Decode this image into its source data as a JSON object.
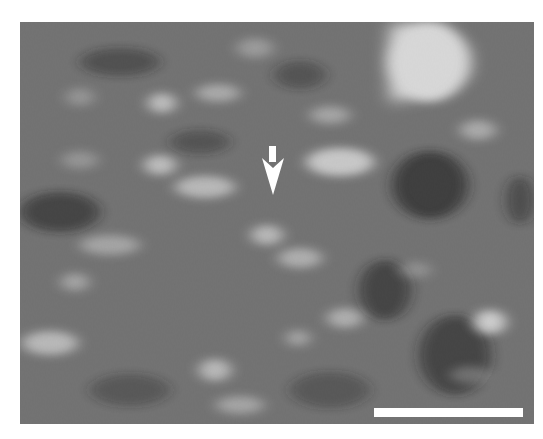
{
  "figure": {
    "type": "grayscale scanning-probe micrograph",
    "image_bounds": {
      "x": 20,
      "y": 22,
      "width": 514,
      "height": 402
    },
    "base_gray": "#717171",
    "annotations": {
      "arrow": {
        "color": "#ffffff",
        "direction": "down",
        "tip": {
          "x": 273,
          "y": 195
        },
        "shaft": {
          "x": 269,
          "y": 146,
          "width": 7,
          "height": 16
        },
        "head": {
          "left": 262,
          "right": 284,
          "top": 158,
          "bottom": 195
        }
      },
      "scale_bar": {
        "color": "#ffffff",
        "x": 374,
        "y": 408,
        "width": 149,
        "height": 9,
        "label": ""
      }
    },
    "bright_features": [
      {
        "cx": 428,
        "cy": 62,
        "rx": 42,
        "ry": 40,
        "opacity": 1.0
      },
      {
        "cx": 162,
        "cy": 103,
        "rx": 14,
        "ry": 10,
        "opacity": 0.75
      },
      {
        "cx": 218,
        "cy": 93,
        "rx": 22,
        "ry": 9,
        "opacity": 0.55
      },
      {
        "cx": 255,
        "cy": 48,
        "rx": 18,
        "ry": 10,
        "opacity": 0.4
      },
      {
        "cx": 80,
        "cy": 97,
        "rx": 14,
        "ry": 9,
        "opacity": 0.35
      },
      {
        "cx": 330,
        "cy": 115,
        "rx": 20,
        "ry": 9,
        "opacity": 0.5
      },
      {
        "cx": 478,
        "cy": 130,
        "rx": 18,
        "ry": 10,
        "opacity": 0.55
      },
      {
        "cx": 160,
        "cy": 165,
        "rx": 16,
        "ry": 10,
        "opacity": 0.75
      },
      {
        "cx": 340,
        "cy": 162,
        "rx": 34,
        "ry": 14,
        "opacity": 0.85
      },
      {
        "cx": 205,
        "cy": 187,
        "rx": 30,
        "ry": 11,
        "opacity": 0.7
      },
      {
        "cx": 267,
        "cy": 235,
        "rx": 16,
        "ry": 10,
        "opacity": 0.7
      },
      {
        "cx": 110,
        "cy": 245,
        "rx": 30,
        "ry": 10,
        "opacity": 0.5
      },
      {
        "cx": 300,
        "cy": 258,
        "rx": 22,
        "ry": 10,
        "opacity": 0.6
      },
      {
        "cx": 75,
        "cy": 282,
        "rx": 14,
        "ry": 9,
        "opacity": 0.5
      },
      {
        "cx": 345,
        "cy": 318,
        "rx": 18,
        "ry": 10,
        "opacity": 0.6
      },
      {
        "cx": 490,
        "cy": 322,
        "rx": 16,
        "ry": 12,
        "opacity": 0.9
      },
      {
        "cx": 50,
        "cy": 343,
        "rx": 28,
        "ry": 12,
        "opacity": 0.7
      },
      {
        "cx": 215,
        "cy": 370,
        "rx": 16,
        "ry": 11,
        "opacity": 0.7
      },
      {
        "cx": 298,
        "cy": 338,
        "rx": 12,
        "ry": 8,
        "opacity": 0.5
      },
      {
        "cx": 240,
        "cy": 405,
        "rx": 24,
        "ry": 9,
        "opacity": 0.5
      },
      {
        "cx": 80,
        "cy": 160,
        "rx": 18,
        "ry": 9,
        "opacity": 0.35
      },
      {
        "cx": 415,
        "cy": 270,
        "rx": 16,
        "ry": 8,
        "opacity": 0.3
      },
      {
        "cx": 470,
        "cy": 375,
        "rx": 20,
        "ry": 9,
        "opacity": 0.3
      }
    ],
    "dark_features": [
      {
        "cx": 430,
        "cy": 185,
        "rx": 38,
        "ry": 34,
        "opacity": 0.85
      },
      {
        "cx": 60,
        "cy": 212,
        "rx": 40,
        "ry": 20,
        "opacity": 0.7
      },
      {
        "cx": 385,
        "cy": 290,
        "rx": 26,
        "ry": 30,
        "opacity": 0.7
      },
      {
        "cx": 455,
        "cy": 355,
        "rx": 36,
        "ry": 40,
        "opacity": 0.7
      },
      {
        "cx": 120,
        "cy": 62,
        "rx": 40,
        "ry": 14,
        "opacity": 0.55
      },
      {
        "cx": 200,
        "cy": 142,
        "rx": 30,
        "ry": 12,
        "opacity": 0.5
      },
      {
        "cx": 300,
        "cy": 75,
        "rx": 26,
        "ry": 14,
        "opacity": 0.5
      },
      {
        "cx": 330,
        "cy": 390,
        "rx": 40,
        "ry": 18,
        "opacity": 0.45
      },
      {
        "cx": 130,
        "cy": 390,
        "rx": 40,
        "ry": 16,
        "opacity": 0.45
      },
      {
        "cx": 520,
        "cy": 200,
        "rx": 14,
        "ry": 24,
        "opacity": 0.6
      }
    ]
  }
}
